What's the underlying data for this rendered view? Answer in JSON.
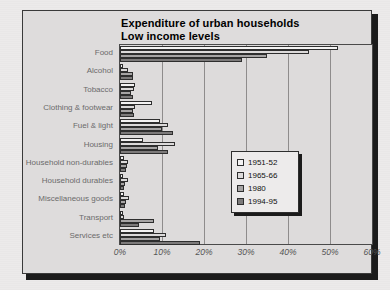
{
  "chart_data": {
    "type": "bar",
    "orientation": "horizontal",
    "title": "Expenditure of urban households",
    "subtitle": "Low income levels",
    "xlabel": "",
    "ylabel": "",
    "xlim": [
      0,
      60
    ],
    "xticks": [
      "0%",
      "10%",
      "20%",
      "30%",
      "40%",
      "50%",
      "60%"
    ],
    "xtick_values": [
      0,
      10,
      20,
      30,
      40,
      50,
      60
    ],
    "grid": true,
    "legend_position": "center-right",
    "categories": [
      "Food",
      "Alcohol",
      "Tobacco",
      "Clothing & footwear",
      "Fuel & light",
      "Housing",
      "Household non-durables",
      "Household durables",
      "Miscellaneous goods",
      "Transport",
      "Services etc"
    ],
    "series": [
      {
        "name": "1951-52",
        "color": "#f4f3f3",
        "values": [
          52.0,
          0.6,
          3.5,
          7.5,
          9.5,
          5.5,
          1.0,
          0.8,
          0.9,
          0.8,
          8.0
        ]
      },
      {
        "name": "1965-66",
        "color": "#dcdada",
        "values": [
          45.0,
          2.0,
          3.3,
          3.6,
          11.5,
          13.0,
          2.0,
          2.0,
          2.1,
          0.9,
          11.0
        ]
      },
      {
        "name": "1980",
        "color": "#a6a4a4",
        "values": [
          35.0,
          3.0,
          2.6,
          3.2,
          10.0,
          9.0,
          1.6,
          1.2,
          1.5,
          8.0,
          9.5
        ]
      },
      {
        "name": "1994-95",
        "color": "#7c7a7a",
        "values": [
          29.0,
          3.2,
          3.0,
          3.3,
          12.5,
          11.5,
          1.4,
          1.0,
          1.3,
          4.5,
          19.0
        ]
      }
    ]
  },
  "legend": {
    "entries": [
      {
        "label": "1951-52",
        "swatch": "#f4f3f3"
      },
      {
        "label": "1965-66",
        "swatch": "#dcdada"
      },
      {
        "label": "1980",
        "swatch": "#a6a4a4"
      },
      {
        "label": "1994-95",
        "swatch": "#7c7a7a"
      }
    ]
  },
  "colors": {
    "page_background": "#eceaea",
    "chart_background": "#dedcdc",
    "plot_background": "#dddbdb",
    "frame_border": "#3a3a3a",
    "gridline": "#8e8c8c",
    "category_label": "#6b6b6b",
    "axis_label": "#555555",
    "bar_outline": "#2e2e2e"
  }
}
